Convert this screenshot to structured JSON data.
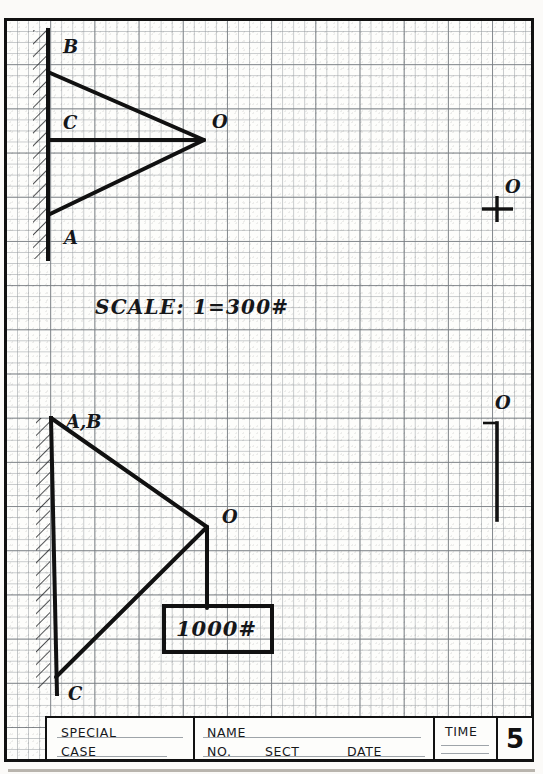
{
  "sheet": {
    "kind": "engineering-graph-paper-worksheet",
    "scale_note": "SCALE:  1=300#",
    "load_label": "1000#"
  },
  "upper_diagram": {
    "name": "force-polygon-upper",
    "labels": {
      "b": "B",
      "c": "C",
      "a": "A",
      "o": "O",
      "o_right": "O"
    }
  },
  "lower_diagram": {
    "name": "space-diagram-lower",
    "labels": {
      "ab": "A,B",
      "o": "O",
      "c": "C",
      "o_right": "O"
    },
    "weight_box": "1000#"
  },
  "title_block": {
    "special": "SPECIAL",
    "case": "CASE",
    "name": "NAME",
    "no": "NO.",
    "sect": "SECT",
    "date": "DATE",
    "time": "TIME",
    "number": "5"
  },
  "colors": {
    "ink": "#111111",
    "grid_minor": "#969ba0",
    "grid_major": "#787d82",
    "paper": "#fdfdfb"
  }
}
